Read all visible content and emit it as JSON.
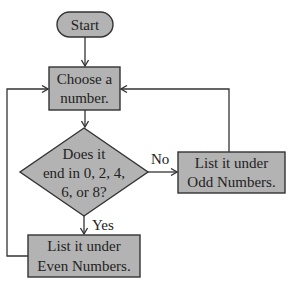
{
  "diagram": {
    "type": "flowchart",
    "colors": {
      "fill": "#b3b3b3",
      "stroke": "#333333",
      "text": "#222222",
      "background": "#ffffff"
    },
    "nodes": {
      "start": {
        "shape": "terminator",
        "label": "Start"
      },
      "choose": {
        "shape": "process",
        "lines": [
          "Choose a",
          "number."
        ]
      },
      "decision": {
        "shape": "decision",
        "lines": [
          "Does it",
          "end in 0, 2, 4,",
          "6, or 8?"
        ]
      },
      "odd": {
        "shape": "process",
        "lines": [
          "List it under",
          "Odd Numbers."
        ]
      },
      "even": {
        "shape": "process",
        "lines": [
          "List it under",
          "Even Numbers."
        ]
      }
    },
    "edges": {
      "no_label": "No",
      "yes_label": "Yes"
    }
  }
}
